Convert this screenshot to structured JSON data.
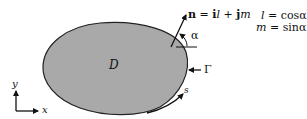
{
  "diagram": {
    "region_label": "D",
    "boundary_label": "Γ",
    "arc_length_label": "s",
    "angle_label": "α",
    "normal_equation": "n = i l + j m",
    "normal_parts": {
      "n": "n",
      "eq": " = ",
      "i": "i",
      "l": "l",
      "plus": " + ",
      "j": "j",
      "m": "m"
    },
    "direction_cosines": [
      {
        "lhs": "l",
        "rhs": " = cosα"
      },
      {
        "lhs": "m",
        "rhs": " = sinα"
      }
    ],
    "axes": {
      "x": "x",
      "y": "y"
    },
    "colors": {
      "fill": "#a9a9a9",
      "stroke": "#222222"
    }
  }
}
